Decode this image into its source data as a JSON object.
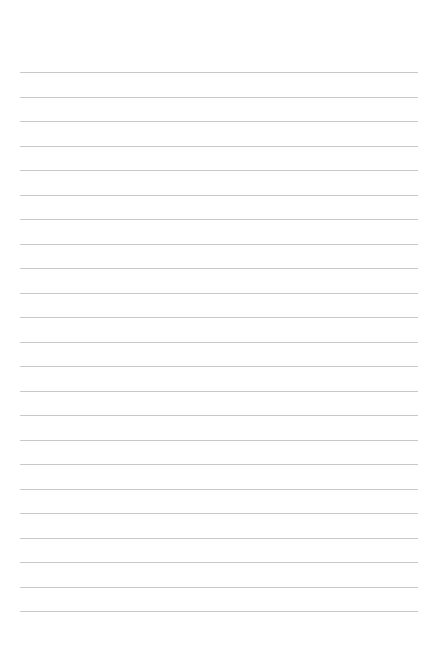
{
  "page": {
    "type": "lined-paper",
    "background_color": "#ffffff",
    "line_color": "#c9c9c9",
    "line_count": 23,
    "first_line_y": 72,
    "line_spacing": 24.5,
    "line_left": 20,
    "line_right": 418
  }
}
